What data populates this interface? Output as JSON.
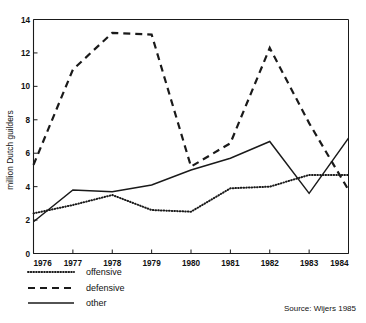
{
  "chart_data": {
    "type": "line",
    "title": "",
    "subtitle": "",
    "xlabel": "",
    "ylabel": "million Dutch guilders",
    "x": [
      1976,
      1977,
      1978,
      1979,
      1980,
      1981,
      1982,
      1983,
      1984
    ],
    "categories": [
      "1976",
      "1977",
      "1978",
      "1979",
      "1980",
      "1981",
      "1982",
      "1983",
      "1984"
    ],
    "xlim": [
      1976,
      1984
    ],
    "ylim": [
      0,
      14
    ],
    "yticks": [
      0,
      2,
      4,
      6,
      8,
      10,
      12,
      14
    ],
    "ytick_labels": [
      "0",
      "2",
      "4",
      "6",
      "8",
      "10",
      "12",
      "14"
    ],
    "xtick_labels": [
      "1976",
      "1977",
      "1978",
      "1979",
      "1980",
      "1981",
      "1982",
      "1983",
      "1984"
    ],
    "grid": false,
    "legend_position": "below-left",
    "series": [
      {
        "name": "offensive",
        "style": "dotted",
        "values": [
          2.4,
          2.9,
          3.5,
          2.6,
          2.5,
          3.9,
          4.0,
          4.7,
          4.7
        ]
      },
      {
        "name": "defensive",
        "style": "dashed",
        "values": [
          5.3,
          11.0,
          13.2,
          13.1,
          5.2,
          6.6,
          12.3,
          7.8,
          3.8
        ]
      },
      {
        "name": "other",
        "style": "solid",
        "values": [
          1.9,
          3.8,
          3.7,
          4.1,
          5.0,
          5.7,
          6.7,
          3.6,
          6.9
        ]
      }
    ],
    "annotations": [
      "Source: Wijers 1985"
    ]
  },
  "axis": {
    "y_label": "million Dutch guilders"
  },
  "legend": {
    "items": [
      {
        "label": "offensive"
      },
      {
        "label": "defensive"
      },
      {
        "label": "other"
      }
    ]
  },
  "source": {
    "text": "Source: Wijers 1985"
  },
  "colors": {
    "ink": "#1a1a1a",
    "background": "#ffffff"
  }
}
